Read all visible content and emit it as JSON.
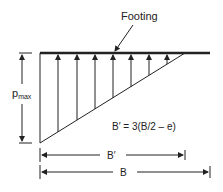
{
  "diagram": {
    "title": "Footing",
    "pressure_label": "p",
    "pressure_subscript": "max",
    "equation": "B′ = 3(B/2 – e)",
    "dim_b_prime": "B′",
    "dim_b": "B",
    "arrow_count": 7,
    "colors": {
      "line": "#222222",
      "background": "#ffffff"
    }
  }
}
